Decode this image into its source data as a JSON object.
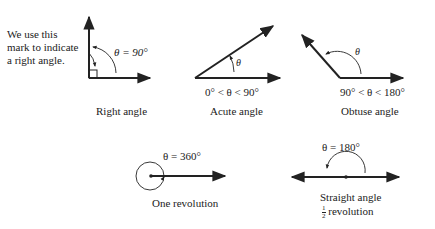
{
  "note": {
    "lines": [
      "We use this",
      "mark to indicate",
      "a right angle."
    ]
  },
  "angles": [
    {
      "id": "right",
      "theta_label": "θ = 90°",
      "caption": "Right angle"
    },
    {
      "id": "acute",
      "theta_label": "θ",
      "range": "0° < θ < 90°",
      "caption": "Acute angle"
    },
    {
      "id": "obtuse",
      "theta_label": "θ",
      "range": "90° < θ < 180°",
      "caption": "Obtuse angle"
    },
    {
      "id": "revolution",
      "theta_label": "θ = 360°",
      "caption": "One revolution"
    },
    {
      "id": "straight",
      "theta_label": "θ = 180°",
      "caption": "Straight angle",
      "subcaption_num": "1",
      "subcaption_den": "2",
      "subcaption_text": "revolution"
    }
  ],
  "colors": {
    "ink": "#222222",
    "background": "#ffffff"
  }
}
